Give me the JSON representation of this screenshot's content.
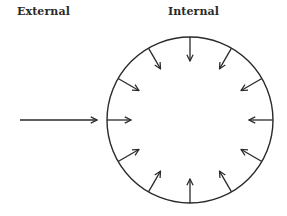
{
  "labels": {
    "external": "External",
    "internal": "Internal"
  },
  "colors": {
    "stroke": "#2a2a2a",
    "background": "#ffffff"
  },
  "diagram": {
    "circle": {
      "cx": 190,
      "cy": 120,
      "r": 83
    },
    "external_arrow": {
      "x1": 20,
      "y1": 120,
      "x2": 97,
      "y2": 120
    },
    "internal_arrow_count": 12,
    "internal_arrow_length": 24
  }
}
